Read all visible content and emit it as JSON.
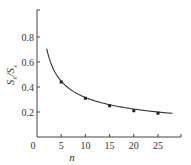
{
  "chart_data": {
    "type": "line",
    "title": "",
    "xlabel": "n",
    "ylabel": "S_x̄ / S_x",
    "ylabel_main": "S",
    "ylabel_sub1": "x̄",
    "ylabel_sep": "/S",
    "ylabel_sub2": "x",
    "xlim": [
      0,
      30
    ],
    "ylim": [
      0,
      1.0
    ],
    "x_ticks": [
      0,
      5,
      10,
      15,
      20,
      25
    ],
    "x_tick_labels": [
      "0",
      "5",
      "10",
      "15",
      "20",
      "25"
    ],
    "y_ticks": [
      0.2,
      0.4,
      0.6,
      0.8
    ],
    "y_tick_labels": [
      "0.2",
      "0.4",
      "0.6",
      "0.8"
    ],
    "grid": false,
    "legend": null,
    "series": [
      {
        "name": "S_x̄/S_x = 1/√n",
        "curve_x_range": [
          2,
          28
        ],
        "markers": true,
        "x": [
          5,
          10,
          15,
          20,
          25
        ],
        "values": [
          0.44,
          0.31,
          0.25,
          0.21,
          0.19
        ]
      }
    ],
    "colors": {
      "line": "#333333",
      "axis": "#444444",
      "background": "#ffffff"
    }
  }
}
